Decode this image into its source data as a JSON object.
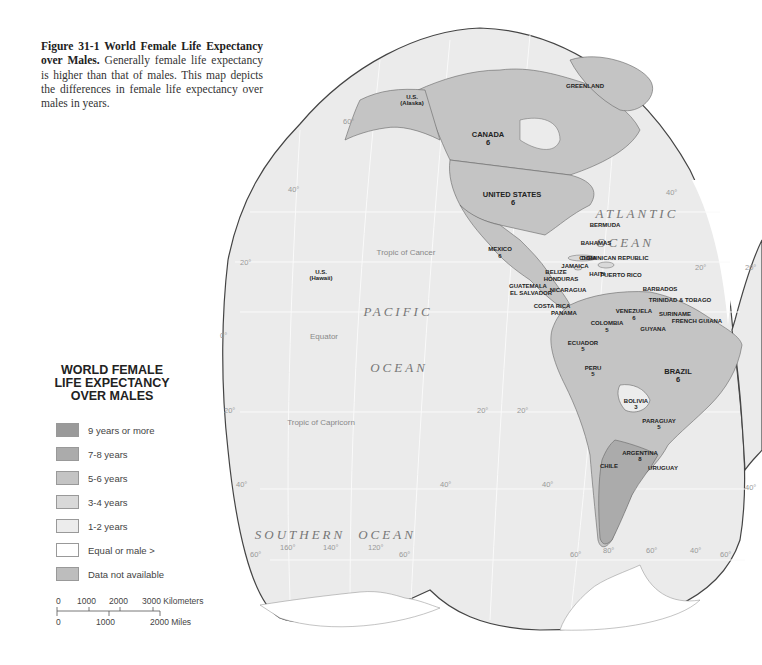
{
  "caption": {
    "figure_label": "Figure 31-1 World Female Life Expectancy over Males.",
    "text": "Generally female life expectancy is higher than that of males. This map depicts the differences in female life expectancy over males in years."
  },
  "legend": {
    "title_line1": "WORLD FEMALE",
    "title_line2": "LIFE EXPECTANCY",
    "title_line3": "OVER MALES",
    "items": [
      {
        "label": "9 years or more",
        "color": "#9a9a9a"
      },
      {
        "label": "7-8 years",
        "color": "#ababab"
      },
      {
        "label": "5-6 years",
        "color": "#c4c4c4"
      },
      {
        "label": "3-4 years",
        "color": "#d9d9d9"
      },
      {
        "label": "1-2 years",
        "color": "#ececec"
      },
      {
        "label": "Equal or male >",
        "color": "#ffffff"
      },
      {
        "label": "Data not available",
        "color": "#bdbdbd"
      }
    ]
  },
  "scale": {
    "km_ticks": [
      "0",
      "1000",
      "2000",
      "3000 Kilometers"
    ],
    "mile_ticks": [
      "0",
      "1000",
      "2000 Miles"
    ]
  },
  "oceans": {
    "pacific_1": "PACIFIC",
    "pacific_2": "OCEAN",
    "atlantic_1": "ATLANTIC",
    "atlantic_2": "OCEAN",
    "southern_1": "SOUTHERN",
    "southern_2": "OCEAN"
  },
  "lines": {
    "cancer": "Tropic of Cancer",
    "equator": "Equator",
    "capricorn": "Tropic of Capricorn"
  },
  "graticule": {
    "lat_60n": "60°",
    "lat_40n_w": "40°",
    "lat_20n_w": "20°",
    "lat_0": "0°",
    "lat_20s_w": "20°",
    "lat_40s_w": "40°",
    "lat_60s_w": "60°",
    "lon_160": "160°",
    "lon_140": "140°",
    "lon_120": "120°",
    "lat_60s_e1": "60°",
    "lat_40n_e": "40°",
    "lat_20n_e": "20°",
    "lat_20n_far": "20°",
    "lat_20s_m": "20°",
    "lat_20s_sa": "20°",
    "lat_40s_m": "40°",
    "lat_40s_sa": "40°",
    "lat_40s_far": "40°",
    "lat_60s_sa": "60°",
    "lon_80": "80°",
    "lon_60": "60°",
    "lon_40": "40°",
    "lat_60s_e2": "60°"
  },
  "countries": [
    {
      "name": "U.S.",
      "sub": "(Alaska)",
      "value": ""
    },
    {
      "name": "GREENLAND",
      "value": ""
    },
    {
      "name": "CANADA",
      "value": "6"
    },
    {
      "name": "UNITED STATES",
      "value": "6"
    },
    {
      "name": "MEXICO",
      "value": "6"
    },
    {
      "name": "BERMUDA",
      "value": ""
    },
    {
      "name": "BAHAMAS",
      "value": "7"
    },
    {
      "name": "CUBA",
      "value": "3"
    },
    {
      "name": "DOMINICAN REPUBLIC",
      "value": "4"
    },
    {
      "name": "JAMAICA",
      "value": "4"
    },
    {
      "name": "HAITI",
      "value": "3"
    },
    {
      "name": "PUERTO RICO",
      "value": ""
    },
    {
      "name": "BELIZE",
      "value": "4"
    },
    {
      "name": "HONDURAS",
      "value": "5"
    },
    {
      "name": "GUATEMALA",
      "value": "6"
    },
    {
      "name": "EL SALVADOR",
      "value": ""
    },
    {
      "name": "NICARAGUA",
      "value": "3"
    },
    {
      "name": "COSTA RICA",
      "value": "4"
    },
    {
      "name": "PANAMA",
      "value": ""
    },
    {
      "name": "BARBADOS",
      "value": "4"
    },
    {
      "name": "TRINIDAD & TOBAGO",
      "value": ""
    },
    {
      "name": "VENEZUELA",
      "value": "6"
    },
    {
      "name": "GUYANA",
      "value": "6"
    },
    {
      "name": "SURINAME",
      "value": "5"
    },
    {
      "name": "FRENCH GUIANA",
      "value": "8"
    },
    {
      "name": "COLOMBIA",
      "value": "5"
    },
    {
      "name": "ECUADOR",
      "value": "5"
    },
    {
      "name": "PERU",
      "value": "5"
    },
    {
      "name": "BRAZIL",
      "value": "6"
    },
    {
      "name": "BOLIVIA",
      "value": "3"
    },
    {
      "name": "PARAGUAY",
      "value": "5"
    },
    {
      "name": "ARGENTINA",
      "value": "8"
    },
    {
      "name": "CHILE",
      "value": "7"
    },
    {
      "name": "URUGUAY",
      "value": "7"
    },
    {
      "name": "U.S.",
      "sub": "(Hawaii)",
      "value": ""
    }
  ]
}
